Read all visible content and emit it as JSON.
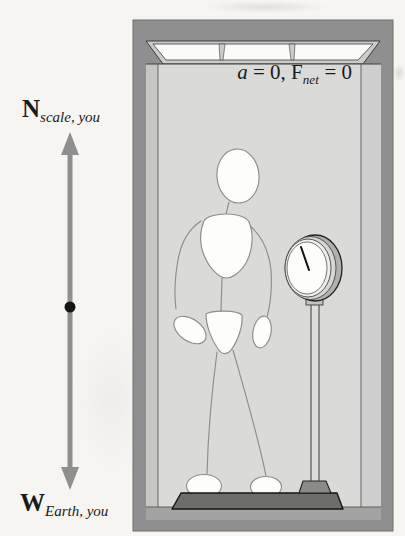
{
  "figure": {
    "elevator": {
      "equation": {
        "accel_var": "a",
        "accel_rhs": " = 0, ",
        "force_var": "F",
        "force_sub": "net",
        "force_rhs": " = 0"
      }
    },
    "force_diagram": {
      "normal_force": {
        "symbol": "N",
        "subscript": "scale, you"
      },
      "weight_force": {
        "symbol": "W",
        "subscript": "Earth, you"
      }
    },
    "colors": {
      "frame_gray": "#8f8f8f",
      "side_wall_gray": "#c6c6c4",
      "back_wall_gray": "#dadad8",
      "ceiling_gray": "#cbcbc9",
      "light_white": "#fbfbf9",
      "floor_gray": "#a3a3a1",
      "platform_gray": "#6d6d6b",
      "arrow_gray": "#8f8f8f",
      "ink_black": "#1a1a1a"
    }
  }
}
